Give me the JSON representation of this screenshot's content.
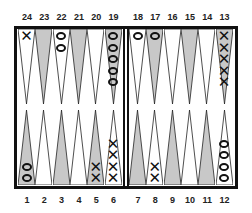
{
  "board": {
    "title": "Backgammon board",
    "colors": {
      "light": "#ffffff",
      "dark": "#c8c8c8",
      "line": "#111111"
    },
    "top_labels": [
      "24",
      "23",
      "22",
      "21",
      "20",
      "19",
      "18",
      "17",
      "16",
      "15",
      "14",
      "13"
    ],
    "bottom_labels": [
      "1",
      "2",
      "3",
      "4",
      "5",
      "6",
      "7",
      "8",
      "9",
      "10",
      "11",
      "12"
    ],
    "points": [
      {
        "n": 1,
        "fill": "dark",
        "checker": "O",
        "count": 2
      },
      {
        "n": 2,
        "fill": "light",
        "checker": "",
        "count": 0
      },
      {
        "n": 3,
        "fill": "dark",
        "checker": "",
        "count": 0
      },
      {
        "n": 4,
        "fill": "light",
        "checker": "",
        "count": 0
      },
      {
        "n": 5,
        "fill": "dark",
        "checker": "X",
        "count": 2
      },
      {
        "n": 6,
        "fill": "light",
        "checker": "X",
        "count": 4
      },
      {
        "n": 7,
        "fill": "dark",
        "checker": "",
        "count": 0
      },
      {
        "n": 8,
        "fill": "light",
        "checker": "X",
        "count": 2
      },
      {
        "n": 9,
        "fill": "dark",
        "checker": "",
        "count": 0
      },
      {
        "n": 10,
        "fill": "light",
        "checker": "",
        "count": 0
      },
      {
        "n": 11,
        "fill": "dark",
        "checker": "",
        "count": 0
      },
      {
        "n": 12,
        "fill": "light",
        "checker": "O",
        "count": 4
      },
      {
        "n": 13,
        "fill": "dark",
        "checker": "X",
        "count": 5
      },
      {
        "n": 14,
        "fill": "light",
        "checker": "",
        "count": 0
      },
      {
        "n": 15,
        "fill": "dark",
        "checker": "",
        "count": 0
      },
      {
        "n": 16,
        "fill": "light",
        "checker": "",
        "count": 0
      },
      {
        "n": 17,
        "fill": "dark",
        "checker": "O",
        "count": 1
      },
      {
        "n": 18,
        "fill": "light",
        "checker": "O",
        "count": 1
      },
      {
        "n": 19,
        "fill": "dark",
        "checker": "O",
        "count": 5
      },
      {
        "n": 20,
        "fill": "light",
        "checker": "",
        "count": 0
      },
      {
        "n": 21,
        "fill": "dark",
        "checker": "",
        "count": 0
      },
      {
        "n": 22,
        "fill": "light",
        "checker": "O",
        "count": 2
      },
      {
        "n": 23,
        "fill": "dark",
        "checker": "",
        "count": 0
      },
      {
        "n": 24,
        "fill": "light",
        "checker": "X",
        "count": 1
      }
    ]
  }
}
